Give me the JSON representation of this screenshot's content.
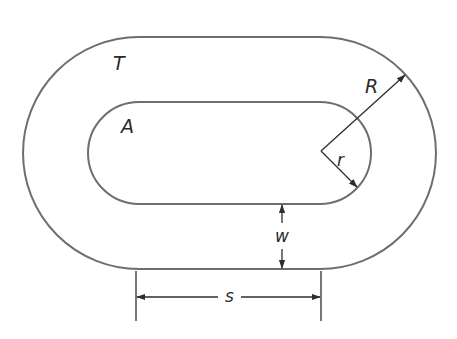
{
  "diagram": {
    "labels": {
      "track": "T",
      "inner_area": "A",
      "outer_radius": "R",
      "inner_radius": "r",
      "width": "w",
      "straight_length": "s"
    },
    "colors": {
      "outline": "#6e6e6e",
      "dimension": "#2e2e2e",
      "text": "#2a2a2a",
      "background": "#ffffff"
    },
    "geometry": {
      "left_center": [
        139,
        153
      ],
      "right_center": [
        320,
        153
      ],
      "outer_radius_px": 116,
      "inner_radius_px": 51
    }
  }
}
